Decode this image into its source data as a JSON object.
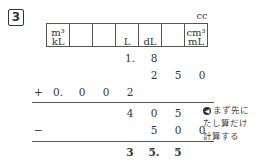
{
  "problem": {
    "number": "3"
  },
  "unit_table": {
    "above_last": "cc",
    "columns": [
      {
        "top": "m³",
        "bottom": "kL"
      },
      {
        "top": "",
        "bottom": ""
      },
      {
        "top": "",
        "bottom": ""
      },
      {
        "top": "",
        "bottom": "L"
      },
      {
        "top": "",
        "bottom": "dL"
      },
      {
        "top": "",
        "bottom": ""
      },
      {
        "top": "cm³",
        "bottom": "mL"
      }
    ]
  },
  "rows": [
    {
      "op": "",
      "cells": [
        "",
        "",
        "",
        "1.",
        "8",
        "",
        ""
      ]
    },
    {
      "op": "",
      "cells": [
        "",
        "",
        "",
        "",
        "2",
        "5",
        "0"
      ]
    },
    {
      "op": "+",
      "cells": [
        "0.",
        "0",
        "0",
        "2",
        "",
        "",
        ""
      ]
    },
    {
      "op": "",
      "cells": [
        "",
        "",
        "",
        "4",
        "0",
        "5",
        ""
      ]
    },
    {
      "op": "−",
      "cells": [
        "",
        "",
        "",
        "",
        "5",
        "0",
        "0"
      ]
    },
    {
      "op": "",
      "cells": [
        "",
        "",
        "",
        "3",
        "5.",
        "5",
        ""
      ]
    }
  ],
  "note": {
    "icon": "circle-arrow-icon",
    "lines": [
      "まず先に",
      "たし算だけ",
      "計算する"
    ]
  }
}
